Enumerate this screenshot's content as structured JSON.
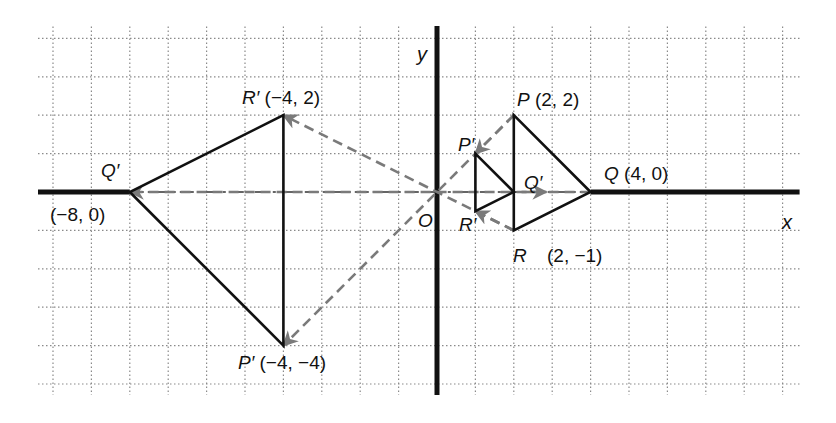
{
  "figure": {
    "type": "dilation-diagram",
    "origin_px": [
      437,
      192
    ],
    "unit_px": 38.4,
    "grid": {
      "x_min": -10,
      "x_max": 9,
      "y_min": -5,
      "y_max": 4
    },
    "axes": {
      "x_label": "x",
      "y_label": "y",
      "origin_label": "O"
    },
    "colors": {
      "ink": "#111111",
      "grid": "#8a8a8a",
      "ray": "#7a7a7a",
      "background": "#ffffff"
    }
  },
  "triangles": {
    "original": {
      "vertices": [
        {
          "name": "P",
          "x": 2,
          "y": 2
        },
        {
          "name": "Q",
          "x": 4,
          "y": 0
        },
        {
          "name": "R",
          "x": 2,
          "y": -1
        }
      ]
    },
    "image_half": {
      "scale_factor": 0.5,
      "vertices": [
        {
          "name": "P'",
          "x": 1,
          "y": 1
        },
        {
          "name": "Q'",
          "x": 2,
          "y": 0
        },
        {
          "name": "R'",
          "x": 1,
          "y": -0.5
        }
      ]
    },
    "image_neg2": {
      "scale_factor": -2,
      "vertices": [
        {
          "name": "P'",
          "x": -4,
          "y": -4
        },
        {
          "name": "Q'",
          "x": -8,
          "y": 0
        },
        {
          "name": "R'",
          "x": -4,
          "y": 2
        }
      ]
    }
  },
  "labels": {
    "y_axis": "y",
    "x_axis": "x",
    "origin": "O",
    "P_name": "P",
    "P_coords": "(2, 2)",
    "Q_name": "Q",
    "Q_coords": "(4, 0)",
    "R_name": "R",
    "R_coords": "(2, −1)",
    "small_P": "P′",
    "small_Q": "Q′",
    "small_R": "R′",
    "big_R_name": "R′",
    "big_R_coords": "(−4, 2)",
    "big_Q_name": "Q′",
    "big_Q_coords": "(−8, 0)",
    "big_P_name": "P′",
    "big_P_coords": "(−4, −4)"
  }
}
